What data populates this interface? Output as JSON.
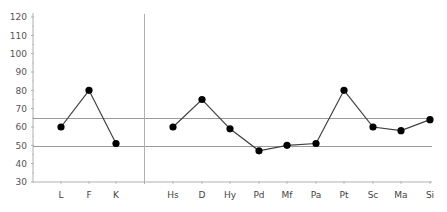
{
  "chart_data": {
    "type": "line",
    "title": "",
    "xlabel": "",
    "ylabel": "",
    "ylim": [
      30,
      120
    ],
    "yticks": [
      30,
      40,
      50,
      60,
      70,
      80,
      90,
      100,
      110,
      120
    ],
    "grid": false,
    "legend": null,
    "categories": [
      "L",
      "F",
      "K",
      "Hs",
      "D",
      "Hy",
      "Pd",
      "Mf",
      "Pa",
      "Pt",
      "Sc",
      "Ma",
      "Si"
    ],
    "groups": [
      {
        "name": "validity",
        "categories": [
          "L",
          "F",
          "K"
        ],
        "values": [
          60,
          80,
          51
        ]
      },
      {
        "name": "clinical",
        "categories": [
          "Hs",
          "D",
          "Hy",
          "Pd",
          "Mf",
          "Pa",
          "Pt",
          "Sc",
          "Ma",
          "Si"
        ],
        "values": [
          60,
          75,
          59,
          47,
          50,
          51,
          80,
          60,
          58,
          64
        ]
      }
    ],
    "reference_lines": [
      65,
      49.5
    ],
    "divider_after": "K"
  },
  "colors": {
    "axis": "#b0b0b0",
    "reference_line": "#9a9a9a",
    "series_line": "#404040",
    "marker": "#000000",
    "divider": "#b0b0b0"
  }
}
